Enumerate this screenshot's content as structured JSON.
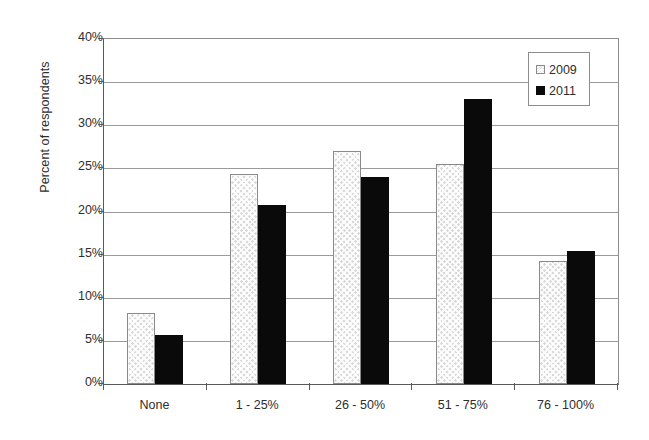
{
  "chart_data": {
    "type": "bar",
    "title": "",
    "subtitle": "",
    "xlabel": "",
    "ylabel": "Percent of respondents",
    "categories": [
      "None",
      "1 - 25%",
      "26 - 50%",
      "51 - 75%",
      "76 - 100%"
    ],
    "series": [
      {
        "name": "2009",
        "values": [
          8.2,
          24.3,
          27.0,
          25.5,
          14.3
        ],
        "color": "#d9d9d9",
        "pattern": "cross-hatch"
      },
      {
        "name": "2011",
        "values": [
          5.7,
          20.7,
          24.0,
          33.1,
          15.4
        ],
        "color": "#0a0a0a",
        "pattern": "solid"
      }
    ],
    "ylim": [
      0,
      40
    ],
    "ytick_values": [
      0,
      5,
      10,
      15,
      20,
      25,
      30,
      35,
      40
    ],
    "ytick_labels": [
      "0%",
      "5%",
      "10%",
      "15%",
      "20%",
      "25%",
      "30%",
      "35%",
      "40%"
    ],
    "grid": "horizontal",
    "legend_position": "top-right",
    "legend_entries": [
      "2009",
      "2011"
    ],
    "value_unit": "percent"
  }
}
